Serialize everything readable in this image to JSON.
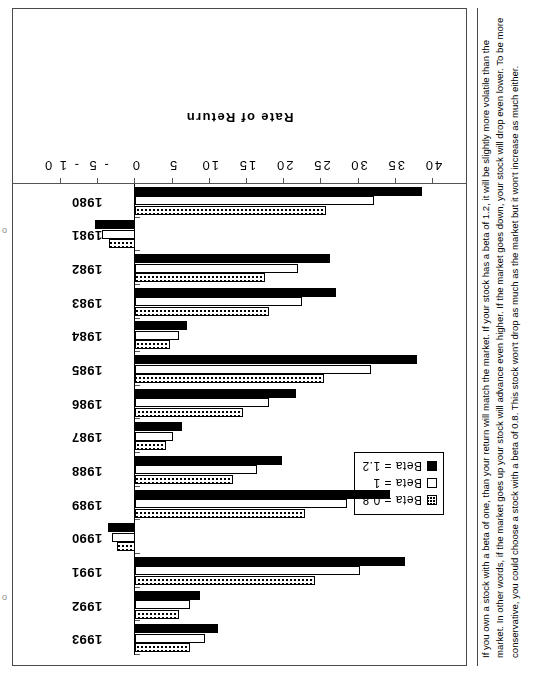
{
  "page": {
    "marker_top": "o",
    "marker_bottom": "o"
  },
  "caption": {
    "text": "If you own a stock with a beta of one, than your return will match the market.  If your stock has a beta of 1.2, it will be slightly more volatile than the market.  In other words, if the market goes up your stock will advance even higher.  If the market goes down, your stock will drop even lower.  To be more conservative, you could choose a stock with a beta of 0.8.  This stock won't drop as much as the market but it won't increase as much either."
  },
  "chart_data": {
    "type": "bar",
    "orientation": "horizontal",
    "title": "",
    "xlabel": "Rate of Return",
    "ylabel": "",
    "grid": false,
    "legend_position": "upper-left",
    "axis_ticks": [
      "40",
      "35",
      "30",
      "25",
      "20",
      "15",
      "10",
      "5",
      "0",
      "- 5",
      "- 1 0"
    ],
    "axis_tick_values": [
      40,
      35,
      30,
      25,
      20,
      15,
      10,
      5,
      0,
      -5,
      -10
    ],
    "xlim": [
      -10,
      40
    ],
    "categories": [
      "1980",
      "1981",
      "1982",
      "1983",
      "1984",
      "1985",
      "1986",
      "1987",
      "1988",
      "1989",
      "1990",
      "1991",
      "1992",
      "1993"
    ],
    "series": [
      {
        "name": "Beta = 0.8",
        "pattern": "checkered",
        "color": "#000000",
        "values": [
          25.6,
          -3.6,
          17.4,
          17.9,
          4.6,
          25.3,
          14.4,
          4.1,
          13.1,
          22.8,
          -2.5,
          24.2,
          5.8,
          7.4
        ]
      },
      {
        "name": "Beta = 1",
        "pattern": "hollow",
        "color": "#ffffff",
        "values": [
          32.1,
          -4.5,
          21.8,
          22.4,
          5.8,
          31.6,
          18.0,
          5.1,
          16.4,
          28.5,
          -3.1,
          30.2,
          7.3,
          9.3
        ]
      },
      {
        "name": "Beta = 1.2",
        "pattern": "solid",
        "color": "#000000",
        "values": [
          38.5,
          -5.4,
          26.1,
          26.9,
          7.0,
          37.9,
          21.6,
          6.2,
          19.7,
          34.2,
          -3.7,
          36.3,
          8.7,
          11.1
        ]
      }
    ],
    "legend": [
      {
        "label": "Beta = 0.8",
        "swatch": "b08"
      },
      {
        "label": "Beta = 1",
        "swatch": "b10"
      },
      {
        "label": "Beta = 1.2",
        "swatch": "b12"
      }
    ]
  }
}
